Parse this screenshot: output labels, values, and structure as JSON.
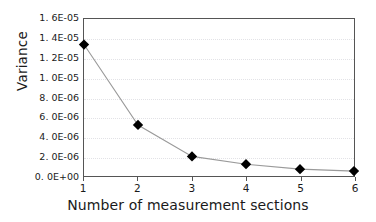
{
  "chart_data": {
    "type": "line",
    "title": "",
    "xlabel": "Number of measurement sections",
    "ylabel": "Variance",
    "x": [
      1,
      2,
      3,
      4,
      5,
      6
    ],
    "values": [
      1.34e-05,
      5.2e-06,
      2e-06,
      1.2e-06,
      7e-07,
      5e-07
    ],
    "series": [
      {
        "name": "Variance",
        "values": [
          1.34e-05,
          5.2e-06,
          2e-06,
          1.2e-06,
          7e-07,
          5e-07
        ]
      }
    ],
    "xlim": [
      1,
      6
    ],
    "ylim": [
      0,
      1.6e-05
    ],
    "grid": true,
    "grid_axis": "y",
    "legend": false,
    "marker": "diamond",
    "marker_color": "#000000",
    "line_color": "#9a9a9a",
    "gridline_color": "#e2e2e6",
    "axis_color": "#555555",
    "background": "#ffffff",
    "ytick_labels": [
      "1. 6E-05",
      "1. 4E-05",
      "1. 2E-05",
      "1. 0E-05",
      "8. 0E-06",
      "6. 0E-06",
      "4. 0E-06",
      "2. 0E-06",
      "0. 0E+00"
    ],
    "ytick_values": [
      1.6e-05,
      1.4e-05,
      1.2e-05,
      1e-05,
      8e-06,
      6e-06,
      4e-06,
      2e-06,
      0
    ],
    "xtick_labels": [
      "1",
      "2",
      "3",
      "4",
      "5",
      "6"
    ],
    "xtick_values": [
      1,
      2,
      3,
      4,
      5,
      6
    ]
  }
}
